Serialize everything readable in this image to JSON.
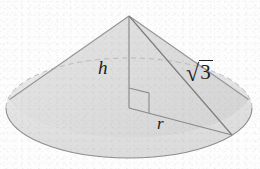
{
  "figure": {
    "kind": "geometry-diagram",
    "background_color": "#fdfdfd",
    "fill_color": "#e3e3e3",
    "stroke_color": "#8e8e8e",
    "label_color": "#1c1c1c",
    "width": 260,
    "height": 169
  },
  "labels": {
    "height": "h",
    "radius": "r",
    "slant_radical_sign": "√",
    "slant_radicand": "3",
    "slant_full": "√3"
  },
  "geometry": {
    "apex": {
      "x": 129,
      "y": 16
    },
    "base_center": {
      "x": 129,
      "y": 108
    },
    "base_ellipse": {
      "cx": 129,
      "cy": 108,
      "rx": 123,
      "ry": 50
    },
    "rim_point": {
      "x": 232,
      "y": 135
    },
    "right_angle_marker": {
      "x": 129,
      "y": 88,
      "size": 20
    },
    "height_segment": {
      "x1": 129,
      "y1": 16,
      "x2": 129,
      "y2": 108
    },
    "radius_segment": {
      "x1": 129,
      "y1": 108,
      "x2": 232,
      "y2": 135
    },
    "slant_segment": {
      "x1": 129,
      "y1": 16,
      "x2": 232,
      "y2": 135
    }
  }
}
